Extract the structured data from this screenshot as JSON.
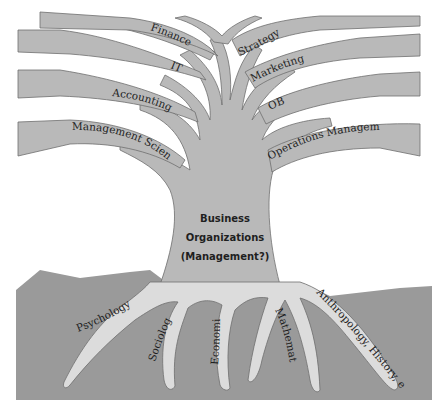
{
  "diagram": {
    "type": "tree-metaphor",
    "colors": {
      "background": "#ffffff",
      "tree": "#b9b9b9",
      "soil": "#999999",
      "roots": "#dcdcdc",
      "outline": "#6e6e6e",
      "text": "#1f1f1f"
    },
    "trunk": {
      "line1": "Business",
      "line2": "Organizations",
      "line3": "(Management?)"
    },
    "branches_left": [
      {
        "label": "Finance"
      },
      {
        "label": "IT"
      },
      {
        "label": "Accounting"
      },
      {
        "label": "Management Science"
      }
    ],
    "branches_right": [
      {
        "label": "Strategy"
      },
      {
        "label": "Marketing"
      },
      {
        "label": "OB"
      },
      {
        "label": "Operations Management"
      }
    ],
    "roots": [
      {
        "label": "Psychology"
      },
      {
        "label": "Sociology"
      },
      {
        "label": "Economics"
      },
      {
        "label": "Mathematics"
      },
      {
        "label": "Anthropology, History, etc"
      }
    ]
  }
}
